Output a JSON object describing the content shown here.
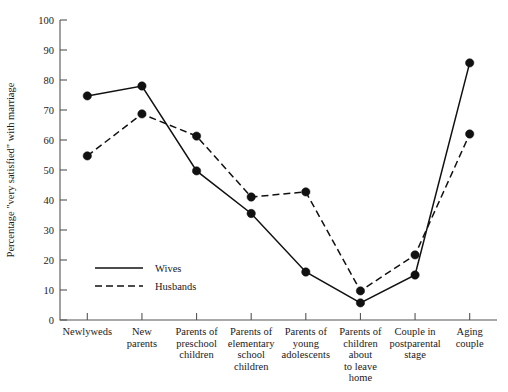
{
  "chart_data": {
    "type": "line",
    "title": "",
    "xlabel": "",
    "ylabel": "Percentage \"very satisfied\" with marriage",
    "ylim": [
      0,
      100
    ],
    "yticks": [
      0,
      10,
      20,
      30,
      40,
      50,
      60,
      70,
      80,
      90,
      100
    ],
    "grid": false,
    "legend_position": "inside-lower-left",
    "categories": [
      "Newlyweds",
      "New parents",
      "Parents of preschool children",
      "Parents of elementary school children",
      "Parents of young adolescents",
      "Parents of children about to leave home",
      "Couple in postparental stage",
      "Aging couple"
    ],
    "category_lines": [
      [
        "Newlyweds"
      ],
      [
        "New",
        "parents"
      ],
      [
        "Parents of",
        "preschool",
        "children"
      ],
      [
        "Parents of",
        "elementary",
        "school",
        "children"
      ],
      [
        "Parents of",
        "young",
        "adolescents"
      ],
      [
        "Parents of",
        "children",
        "about",
        "to leave",
        "home"
      ],
      [
        "Couple in",
        "postparental",
        "stage"
      ],
      [
        "Aging",
        "couple"
      ]
    ],
    "series": [
      {
        "name": "Wives",
        "style": "solid",
        "values": [
          74.7,
          78,
          49.7,
          35.5,
          16,
          5.7,
          15,
          85.7
        ]
      },
      {
        "name": "Husbands",
        "style": "dashed",
        "values": [
          54.7,
          68.7,
          61.3,
          41,
          42.7,
          9.7,
          21.7,
          62
        ]
      }
    ]
  },
  "legend": {
    "items": [
      {
        "label": "Wives",
        "style": "solid"
      },
      {
        "label": "Husbands",
        "style": "dashed"
      }
    ]
  },
  "colors": {
    "ink": "#111111",
    "axis": "#555555",
    "background": "#ffffff"
  }
}
